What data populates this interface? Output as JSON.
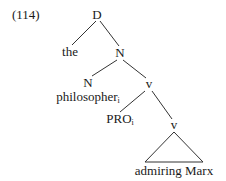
{
  "example_number": "(114)",
  "tree": {
    "root": {
      "label": "D"
    },
    "det": {
      "label": "the"
    },
    "n_phrase": {
      "label": "N"
    },
    "n_head": {
      "label": "N"
    },
    "n_word": {
      "label": "philosopher",
      "index": "i"
    },
    "v_upper": {
      "label": "v"
    },
    "pro": {
      "label": "PRO",
      "index": "i"
    },
    "v_lower": {
      "label": "v"
    },
    "vp_content": {
      "label": "admiring Marx"
    }
  }
}
